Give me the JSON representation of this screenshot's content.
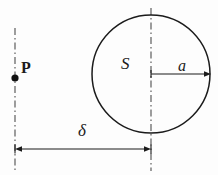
{
  "figure": {
    "background_color": "#fdfdfd",
    "stroke_color": "#1b1b1b",
    "axis_color": "#5a5a5a",
    "labels": {
      "point": "P",
      "region": "S",
      "radius": "a",
      "distance": "δ"
    },
    "geometry": {
      "circle": {
        "center_x": 151,
        "center_y": 74,
        "radius": 59
      },
      "point_marker": {
        "x": 15,
        "y": 78,
        "radius": 3.6
      },
      "left_axis": {
        "x": 15,
        "y_top": 28,
        "y_bottom": 173
      },
      "right_axis": {
        "x": 151,
        "y_top": 8,
        "y_bottom": 171
      },
      "radius_arrow": {
        "x_start": 151,
        "x_end": 210,
        "y": 74
      },
      "distance_arrow": {
        "x_start": 15,
        "x_end": 151,
        "y": 149
      }
    }
  }
}
